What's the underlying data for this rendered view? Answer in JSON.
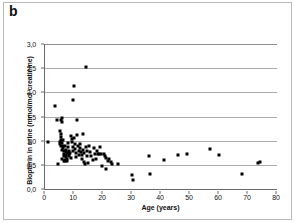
{
  "figure": {
    "panel_label": "b",
    "background_color": "#ffffff",
    "frame_color": "#b9b9b9",
    "marker_color": "#000000",
    "gridline_color": "#aaaaaa",
    "axis_color": "#6a6a6a"
  },
  "chart_data": {
    "type": "scatter",
    "title": "",
    "subtitle": "",
    "xlabel": "Age (years)",
    "ylabel": "Biopterin in urine (mmol/mol creatinine)",
    "xlim": [
      0,
      80
    ],
    "ylim": [
      0,
      3.0
    ],
    "xticks": [
      0,
      10,
      20,
      30,
      40,
      50,
      60,
      70,
      80
    ],
    "xticklabels": [
      "0",
      "10",
      "20",
      "30",
      "40",
      "50",
      "60",
      "70",
      "80"
    ],
    "yticks": [
      0,
      0.5,
      1.0,
      1.5,
      2.0,
      2.5,
      3.0
    ],
    "yticklabels": [
      "0,0",
      "0,5",
      "1,0",
      "1,5",
      "2,0",
      "2,5",
      "3,0"
    ],
    "grid": "horizontal",
    "legend": null,
    "annotations": [],
    "series": [
      {
        "name": "Biopterin in urine",
        "marker": "square",
        "color": "#000000",
        "points": [
          [
            1.0,
            0.97
          ],
          [
            3.4,
            1.71
          ],
          [
            4.0,
            1.43
          ],
          [
            5.6,
            1.43
          ],
          [
            5.8,
            1.46
          ],
          [
            5.9,
            1.38
          ],
          [
            5.2,
            1.2
          ],
          [
            5.4,
            1.13
          ],
          [
            5.6,
            1.07
          ],
          [
            4.6,
            0.51
          ],
          [
            5.0,
            0.98
          ],
          [
            5.2,
            0.93
          ],
          [
            5.4,
            1.02
          ],
          [
            5.6,
            0.88
          ],
          [
            5.8,
            0.8
          ],
          [
            6.0,
            0.96
          ],
          [
            6.1,
            1.02
          ],
          [
            6.2,
            0.9
          ],
          [
            6.3,
            0.84
          ],
          [
            6.4,
            0.78
          ],
          [
            6.5,
            0.73
          ],
          [
            6.6,
            0.69
          ],
          [
            6.0,
            0.62
          ],
          [
            6.4,
            0.58
          ],
          [
            6.8,
            0.6
          ],
          [
            7.0,
            0.88
          ],
          [
            7.1,
            0.8
          ],
          [
            7.2,
            0.76
          ],
          [
            7.3,
            0.71
          ],
          [
            7.4,
            0.67
          ],
          [
            7.5,
            0.62
          ],
          [
            7.0,
            0.57
          ],
          [
            7.6,
            0.57
          ],
          [
            7.8,
            0.74
          ],
          [
            8.0,
            0.95
          ],
          [
            8.1,
            0.86
          ],
          [
            8.2,
            0.79
          ],
          [
            8.3,
            0.73
          ],
          [
            8.4,
            0.68
          ],
          [
            8.6,
            0.75
          ],
          [
            8.8,
            0.64
          ],
          [
            9.0,
            1.09
          ],
          [
            9.2,
            1.04
          ],
          [
            9.4,
            0.98
          ],
          [
            9.5,
            1.84
          ],
          [
            9.6,
            0.86
          ],
          [
            9.8,
            0.78
          ],
          [
            10.0,
            2.14
          ],
          [
            10.0,
            1.06
          ],
          [
            10.2,
            0.93
          ],
          [
            10.4,
            0.82
          ],
          [
            10.6,
            0.74
          ],
          [
            10.8,
            0.66
          ],
          [
            11.0,
            1.43
          ],
          [
            11.2,
            1.11
          ],
          [
            11.4,
            0.88
          ],
          [
            11.6,
            0.79
          ],
          [
            11.8,
            0.71
          ],
          [
            12.0,
            0.93
          ],
          [
            12.2,
            0.85
          ],
          [
            12.4,
            0.77
          ],
          [
            12.6,
            0.7
          ],
          [
            12.8,
            0.62
          ],
          [
            13.0,
            1.14
          ],
          [
            13.2,
            0.81
          ],
          [
            13.4,
            0.74
          ],
          [
            13.6,
            0.56
          ],
          [
            13.8,
            0.52
          ],
          [
            14.0,
            2.53
          ],
          [
            14.2,
            0.87
          ],
          [
            14.4,
            0.79
          ],
          [
            14.6,
            0.69
          ],
          [
            14.8,
            0.53
          ],
          [
            15.2,
            0.9
          ],
          [
            15.6,
            0.76
          ],
          [
            16.0,
            0.68
          ],
          [
            16.4,
            0.59
          ],
          [
            16.8,
            0.84
          ],
          [
            17.2,
            0.73
          ],
          [
            17.6,
            0.63
          ],
          [
            18.0,
            0.78
          ],
          [
            18.4,
            0.72
          ],
          [
            18.6,
            0.72
          ],
          [
            19.0,
            0.87
          ],
          [
            19.4,
            0.73
          ],
          [
            19.8,
            0.47
          ],
          [
            20.2,
            0.73
          ],
          [
            20.6,
            0.68
          ],
          [
            21.0,
            0.64
          ],
          [
            21.2,
            0.41
          ],
          [
            21.6,
            0.58
          ],
          [
            22.0,
            0.62
          ],
          [
            22.6,
            0.55
          ],
          [
            23.0,
            0.51
          ],
          [
            25.0,
            0.52
          ],
          [
            30.0,
            0.3
          ],
          [
            30.2,
            0.18
          ],
          [
            36.0,
            0.69
          ],
          [
            36.2,
            0.32
          ],
          [
            41.0,
            0.59
          ],
          [
            46.0,
            0.71
          ],
          [
            49.0,
            0.72
          ],
          [
            57.0,
            0.82
          ],
          [
            60.0,
            0.7
          ],
          [
            68.0,
            0.32
          ],
          [
            73.4,
            0.54
          ],
          [
            74.0,
            0.56
          ]
        ]
      }
    ]
  }
}
